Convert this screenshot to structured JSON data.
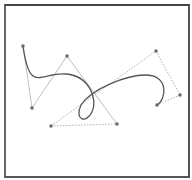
{
  "diagram": {
    "type": "bezier-curve-editor",
    "colors": {
      "curve": "#555555",
      "handle_line": "#b0b0b0",
      "dotted_line": "#9a9a9a",
      "control_point": "#666666",
      "frame": "#555555"
    },
    "curve_path": "M23,46 C30,95 40,72 66,74 C90,76 98,100 92,112 C86,124 74,120 81,105 C92,88 128,75 145,75 C170,75 166,100 157,105",
    "control_points": [
      {
        "id": "p0",
        "x": 23,
        "y": 46
      },
      {
        "id": "p1",
        "x": 32,
        "y": 108
      },
      {
        "id": "p2",
        "x": 67,
        "y": 56
      },
      {
        "id": "p3",
        "x": 117,
        "y": 124
      },
      {
        "id": "p4",
        "x": 51,
        "y": 126
      },
      {
        "id": "p5",
        "x": 156,
        "y": 51
      },
      {
        "id": "p6",
        "x": 180,
        "y": 95
      },
      {
        "id": "p7",
        "x": 157,
        "y": 105
      }
    ],
    "handle_lines": [
      {
        "x1": 23,
        "y1": 46,
        "x2": 32,
        "y2": 108,
        "style": "solid"
      },
      {
        "x1": 32,
        "y1": 108,
        "x2": 67,
        "y2": 56,
        "style": "solid"
      },
      {
        "x1": 67,
        "y1": 56,
        "x2": 117,
        "y2": 124,
        "style": "solid"
      },
      {
        "x1": 51,
        "y1": 126,
        "x2": 117,
        "y2": 124,
        "style": "dotted"
      },
      {
        "x1": 51,
        "y1": 126,
        "x2": 156,
        "y2": 51,
        "style": "dotted"
      },
      {
        "x1": 156,
        "y1": 51,
        "x2": 180,
        "y2": 95,
        "style": "dotted"
      },
      {
        "x1": 180,
        "y1": 95,
        "x2": 157,
        "y2": 105,
        "style": "dotted"
      }
    ]
  }
}
